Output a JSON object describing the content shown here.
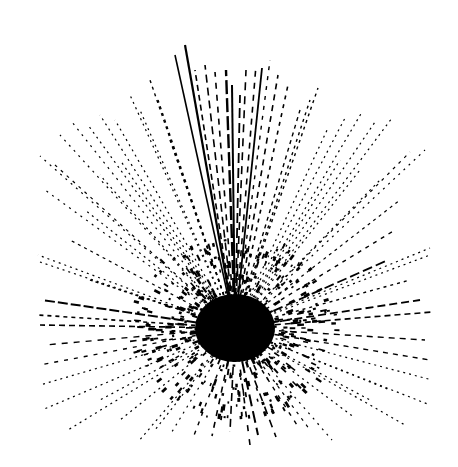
{
  "figure": {
    "width": 458,
    "height": 467,
    "background": "#ffffff",
    "ink": "#000000",
    "center": {
      "x": 235,
      "y": 328
    },
    "core_radius_x": 40,
    "core_radius_y": 34
  },
  "rays": [
    {
      "x": 185,
      "y": 45,
      "w": 2.2,
      "dash": "none"
    },
    {
      "x": 175,
      "y": 55,
      "w": 1.6,
      "dash": "none"
    },
    {
      "x": 195,
      "y": 70,
      "w": 1.6,
      "dash": "6 4"
    },
    {
      "x": 205,
      "y": 65,
      "w": 1.6,
      "dash": "8 5"
    },
    {
      "x": 215,
      "y": 72,
      "w": 1.6,
      "dash": "6 6"
    },
    {
      "x": 226,
      "y": 70,
      "w": 2.4,
      "dash": "14 4"
    },
    {
      "x": 232,
      "y": 85,
      "w": 2.0,
      "dash": "none"
    },
    {
      "x": 240,
      "y": 95,
      "w": 1.8,
      "dash": "10 5"
    },
    {
      "x": 246,
      "y": 70,
      "w": 1.6,
      "dash": "8 6"
    },
    {
      "x": 256,
      "y": 65,
      "w": 1.6,
      "dash": "6 6"
    },
    {
      "x": 262,
      "y": 68,
      "w": 1.8,
      "dash": "none"
    },
    {
      "x": 270,
      "y": 60,
      "w": 1.4,
      "dash": "4 6"
    },
    {
      "x": 278,
      "y": 75,
      "w": 1.6,
      "dash": "6 5"
    },
    {
      "x": 150,
      "y": 80,
      "w": 1.4,
      "dash": "3 4"
    },
    {
      "x": 158,
      "y": 100,
      "w": 1.4,
      "dash": "3 4"
    },
    {
      "x": 140,
      "y": 110,
      "w": 1.2,
      "dash": "2 4"
    },
    {
      "x": 130,
      "y": 95,
      "w": 1.2,
      "dash": "2 4"
    },
    {
      "x": 115,
      "y": 120,
      "w": 1.2,
      "dash": "2 4"
    },
    {
      "x": 100,
      "y": 115,
      "w": 1.2,
      "dash": "2 4"
    },
    {
      "x": 88,
      "y": 125,
      "w": 1.2,
      "dash": "2 4"
    },
    {
      "x": 72,
      "y": 122,
      "w": 1.2,
      "dash": "2 5"
    },
    {
      "x": 60,
      "y": 135,
      "w": 1.2,
      "dash": "2 5"
    },
    {
      "x": 40,
      "y": 156,
      "w": 1.2,
      "dash": "2 5"
    },
    {
      "x": 55,
      "y": 165,
      "w": 1.2,
      "dash": "3 5"
    },
    {
      "x": 45,
      "y": 190,
      "w": 1.2,
      "dash": "2 5"
    },
    {
      "x": 38,
      "y": 255,
      "w": 1.2,
      "dash": "2 4"
    },
    {
      "x": 40,
      "y": 262,
      "w": 1.2,
      "dash": "2 4"
    },
    {
      "x": 42,
      "y": 300,
      "w": 2.0,
      "dash": "10 3"
    },
    {
      "x": 38,
      "y": 315,
      "w": 1.6,
      "dash": "4 4"
    },
    {
      "x": 40,
      "y": 325,
      "w": 1.6,
      "dash": "6 4"
    },
    {
      "x": 45,
      "y": 345,
      "w": 1.4,
      "dash": "6 6"
    },
    {
      "x": 40,
      "y": 365,
      "w": 1.4,
      "dash": "4 6"
    },
    {
      "x": 40,
      "y": 385,
      "w": 1.2,
      "dash": "2 4"
    },
    {
      "x": 42,
      "y": 410,
      "w": 1.2,
      "dash": "2 4"
    },
    {
      "x": 68,
      "y": 430,
      "w": 1.2,
      "dash": "2 4"
    },
    {
      "x": 138,
      "y": 442,
      "w": 1.2,
      "dash": "2 4"
    },
    {
      "x": 170,
      "y": 435,
      "w": 1.2,
      "dash": "2 5"
    },
    {
      "x": 193,
      "y": 438,
      "w": 1.4,
      "dash": "4 6"
    },
    {
      "x": 212,
      "y": 436,
      "w": 1.6,
      "dash": "6 6"
    },
    {
      "x": 230,
      "y": 432,
      "w": 1.6,
      "dash": "8 5"
    },
    {
      "x": 250,
      "y": 445,
      "w": 1.6,
      "dash": "6 8"
    },
    {
      "x": 258,
      "y": 435,
      "w": 2.0,
      "dash": "12 5"
    },
    {
      "x": 276,
      "y": 437,
      "w": 1.6,
      "dash": "8 6"
    },
    {
      "x": 297,
      "y": 425,
      "w": 1.4,
      "dash": "4 6"
    },
    {
      "x": 332,
      "y": 440,
      "w": 1.2,
      "dash": "2 5"
    },
    {
      "x": 355,
      "y": 418,
      "w": 1.2,
      "dash": "2 4"
    },
    {
      "x": 405,
      "y": 425,
      "w": 1.2,
      "dash": "2 4"
    },
    {
      "x": 430,
      "y": 405,
      "w": 1.2,
      "dash": "2 4"
    },
    {
      "x": 432,
      "y": 380,
      "w": 1.2,
      "dash": "2 4"
    },
    {
      "x": 430,
      "y": 360,
      "w": 1.4,
      "dash": "5 5"
    },
    {
      "x": 425,
      "y": 340,
      "w": 1.4,
      "dash": "6 5"
    },
    {
      "x": 432,
      "y": 312,
      "w": 1.6,
      "dash": "6 4"
    },
    {
      "x": 420,
      "y": 300,
      "w": 1.8,
      "dash": "8 4"
    },
    {
      "x": 430,
      "y": 255,
      "w": 1.2,
      "dash": "2 4"
    },
    {
      "x": 430,
      "y": 248,
      "w": 1.2,
      "dash": "2 4"
    },
    {
      "x": 395,
      "y": 230,
      "w": 1.4,
      "dash": "4 5"
    },
    {
      "x": 388,
      "y": 260,
      "w": 1.8,
      "dash": "10 4"
    },
    {
      "x": 425,
      "y": 150,
      "w": 1.2,
      "dash": "2 5"
    },
    {
      "x": 410,
      "y": 152,
      "w": 1.2,
      "dash": "3 5"
    },
    {
      "x": 392,
      "y": 118,
      "w": 1.2,
      "dash": "2 4"
    },
    {
      "x": 375,
      "y": 122,
      "w": 1.2,
      "dash": "2 4"
    },
    {
      "x": 362,
      "y": 112,
      "w": 1.2,
      "dash": "2 4"
    },
    {
      "x": 345,
      "y": 118,
      "w": 1.2,
      "dash": "2 4"
    },
    {
      "x": 328,
      "y": 128,
      "w": 1.2,
      "dash": "2 4"
    },
    {
      "x": 318,
      "y": 88,
      "w": 1.4,
      "dash": "3 4"
    },
    {
      "x": 310,
      "y": 100,
      "w": 1.4,
      "dash": "3 4"
    },
    {
      "x": 300,
      "y": 110,
      "w": 1.4,
      "dash": "4 4"
    },
    {
      "x": 288,
      "y": 85,
      "w": 1.6,
      "dash": "4 5"
    },
    {
      "x": 170,
      "y": 140,
      "w": 1.4,
      "dash": "3 4"
    },
    {
      "x": 120,
      "y": 160,
      "w": 1.2,
      "dash": "2 4"
    },
    {
      "x": 100,
      "y": 175,
      "w": 1.2,
      "dash": "2 4"
    },
    {
      "x": 85,
      "y": 210,
      "w": 1.2,
      "dash": "2 4"
    },
    {
      "x": 70,
      "y": 240,
      "w": 1.2,
      "dash": "3 4"
    },
    {
      "x": 90,
      "y": 280,
      "w": 1.4,
      "dash": "3 3"
    },
    {
      "x": 380,
      "y": 180,
      "w": 1.2,
      "dash": "2 4"
    },
    {
      "x": 360,
      "y": 170,
      "w": 1.2,
      "dash": "2 4"
    },
    {
      "x": 340,
      "y": 160,
      "w": 1.2,
      "dash": "2 4"
    },
    {
      "x": 400,
      "y": 200,
      "w": 1.2,
      "dash": "3 4"
    },
    {
      "x": 410,
      "y": 280,
      "w": 1.4,
      "dash": "3 4"
    },
    {
      "x": 100,
      "y": 400,
      "w": 1.2,
      "dash": "2 4"
    },
    {
      "x": 120,
      "y": 420,
      "w": 1.2,
      "dash": "2 4"
    },
    {
      "x": 155,
      "y": 430,
      "w": 1.2,
      "dash": "2 4"
    },
    {
      "x": 310,
      "y": 430,
      "w": 1.2,
      "dash": "3 5"
    },
    {
      "x": 370,
      "y": 400,
      "w": 1.2,
      "dash": "2 4"
    },
    {
      "x": 390,
      "y": 390,
      "w": 1.2,
      "dash": "2 4"
    }
  ]
}
